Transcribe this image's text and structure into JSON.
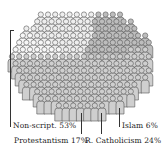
{
  "chart_data": {
    "type": "pie",
    "style": "pictograph-crowd",
    "title": "",
    "categories": [
      "Non-script.",
      "Protestantism",
      "R. Catholicism",
      "Islam"
    ],
    "values": [
      53,
      17,
      24,
      6
    ],
    "unit": "%",
    "colors": [
      "#cfcfcf",
      "#bdbdbd",
      "#eeeeee",
      "#f7f7f7"
    ],
    "labels": [
      {
        "text": "Non-script. 53%"
      },
      {
        "text": "Protestantism 17%"
      },
      {
        "text": "R. Catholicism 24%"
      },
      {
        "text": "Islam 6%"
      }
    ]
  }
}
